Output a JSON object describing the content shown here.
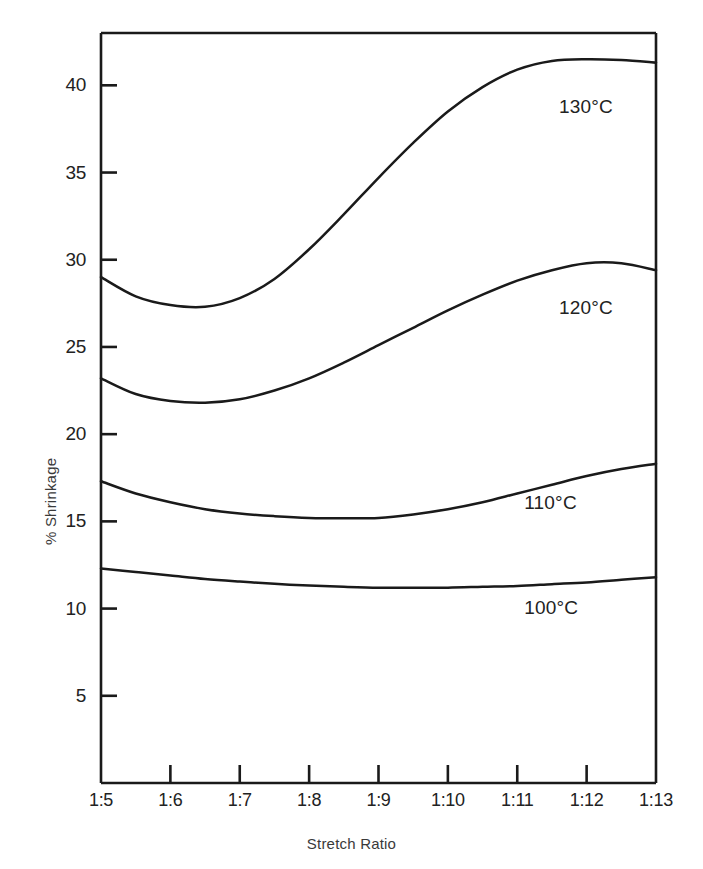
{
  "chart_data": {
    "type": "line",
    "title": "",
    "subtitle": "",
    "xlabel": "Stretch Ratio",
    "ylabel": "% Shrinkage",
    "grid": false,
    "legend_position": "inline-right-annotations",
    "x_tick_labels": [
      "1:5",
      "1:6",
      "1:7",
      "1:8",
      "1:9",
      "1:10",
      "1:11",
      "1:12",
      "1:13"
    ],
    "x_tick_values": [
      5,
      6,
      7,
      8,
      9,
      10,
      11,
      12,
      13
    ],
    "xlim": [
      5,
      13
    ],
    "y_tick_labels": [
      "5",
      "10",
      "15",
      "20",
      "25",
      "30",
      "35",
      "40"
    ],
    "y_tick_values": [
      5,
      10,
      15,
      20,
      25,
      30,
      35,
      40
    ],
    "ylim": [
      0,
      43
    ],
    "x": [
      5,
      5.5,
      6,
      6.5,
      7,
      7.5,
      8,
      8.5,
      9,
      9.5,
      10,
      10.5,
      11,
      11.5,
      12,
      12.5,
      13
    ],
    "series": [
      {
        "name": "130°C",
        "label": "130°C",
        "color": "#1a1a1a",
        "values": [
          29.0,
          27.9,
          27.4,
          27.3,
          27.8,
          28.9,
          30.6,
          32.6,
          34.7,
          36.7,
          38.5,
          39.9,
          40.9,
          41.4,
          41.5,
          41.45,
          41.3
        ]
      },
      {
        "name": "120°C",
        "label": "120°C",
        "color": "#1a1a1a",
        "values": [
          23.2,
          22.3,
          21.9,
          21.8,
          22.0,
          22.5,
          23.2,
          24.1,
          25.1,
          26.1,
          27.1,
          28.0,
          28.8,
          29.4,
          29.8,
          29.8,
          29.4
        ]
      },
      {
        "name": "110°C",
        "label": "110°C",
        "color": "#1a1a1a",
        "values": [
          17.3,
          16.6,
          16.1,
          15.7,
          15.45,
          15.3,
          15.2,
          15.18,
          15.2,
          15.4,
          15.7,
          16.1,
          16.6,
          17.1,
          17.6,
          18.0,
          18.3
        ]
      },
      {
        "name": "100°C",
        "label": "100°C",
        "color": "#1a1a1a",
        "values": [
          12.3,
          12.1,
          11.9,
          11.7,
          11.55,
          11.42,
          11.32,
          11.25,
          11.2,
          11.2,
          11.2,
          11.25,
          11.3,
          11.4,
          11.5,
          11.65,
          11.8
        ]
      }
    ],
    "annotations": [
      {
        "text": "130°C",
        "x": 11.6,
        "y": 38.7
      },
      {
        "text": "120°C",
        "x": 11.6,
        "y": 27.2
      },
      {
        "text": "110°C",
        "x": 11.1,
        "y": 16.0
      },
      {
        "text": "100°C",
        "x": 11.1,
        "y": 10.0
      }
    ]
  }
}
